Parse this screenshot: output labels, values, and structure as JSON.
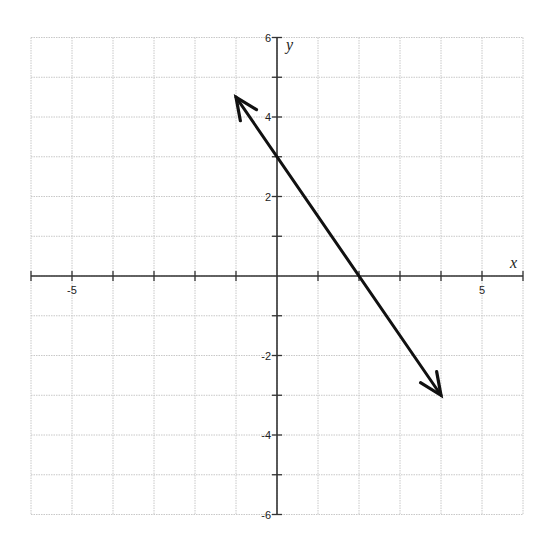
{
  "chart_data": {
    "type": "line",
    "title": "",
    "xlabel": "x",
    "ylabel": "y",
    "xlim": [
      -6,
      6
    ],
    "ylim": [
      -6,
      6
    ],
    "grid": true,
    "grid_step": 1,
    "x_ticks_labeled": [
      -5,
      5
    ],
    "y_ticks_labeled": [
      6,
      4,
      2,
      -2,
      -4,
      -6
    ],
    "x_tick_labels": [
      "-5",
      "5"
    ],
    "y_tick_labels": [
      "6",
      "4",
      "2",
      "-2",
      "-4",
      "-6"
    ],
    "series": [
      {
        "name": "line",
        "equation": "y = -1.5x + 3",
        "x": [
          -1,
          4
        ],
        "y": [
          4.5,
          -3
        ],
        "arrows": "both",
        "color": "#111111"
      }
    ],
    "annotations": []
  },
  "colors": {
    "grid": "#c8c8c8",
    "axis": "#333333",
    "line": "#111111",
    "text": "#222222"
  }
}
